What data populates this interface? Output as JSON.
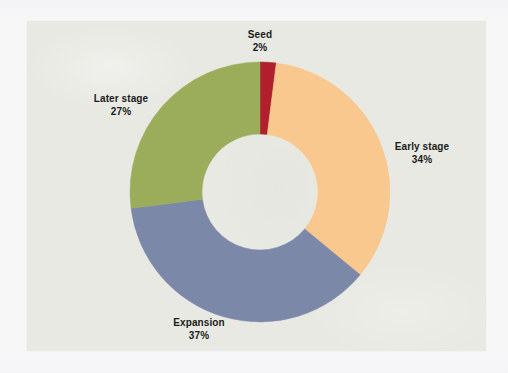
{
  "figure": {
    "background_color": "#f7f7f8",
    "panel_color": "#e9e9e3"
  },
  "chart_data": {
    "type": "pie",
    "variant": "donut",
    "title": "",
    "subtitle": "",
    "xlabel": "",
    "ylabel": "",
    "legend_position": "none",
    "grid": false,
    "label_format": "name + percent",
    "start_angle_deg": 0,
    "direction": "clockwise",
    "center": [
      260,
      192
    ],
    "outer_radius": 130,
    "inner_radius": 58,
    "categories": [
      "Seed",
      "Early stage",
      "Expansion",
      "Later stage"
    ],
    "values": [
      2,
      34,
      37,
      27
    ],
    "value_labels": [
      "2%",
      "34%",
      "37%",
      "27%"
    ],
    "colors": [
      "#b11e2c",
      "#f8c88e",
      "#7c88a8",
      "#9bad5a"
    ],
    "slices": [
      {
        "name": "Seed",
        "value": 2,
        "value_label": "2%",
        "color": "#b11e2c",
        "label_position": "top"
      },
      {
        "name": "Early stage",
        "value": 34,
        "value_label": "34%",
        "color": "#f8c88e",
        "label_position": "right"
      },
      {
        "name": "Expansion",
        "value": 37,
        "value_label": "37%",
        "color": "#7c88a8",
        "label_position": "bottom"
      },
      {
        "name": "Later stage",
        "value": 27,
        "value_label": "27%",
        "color": "#9bad5a",
        "label_position": "left"
      }
    ]
  }
}
